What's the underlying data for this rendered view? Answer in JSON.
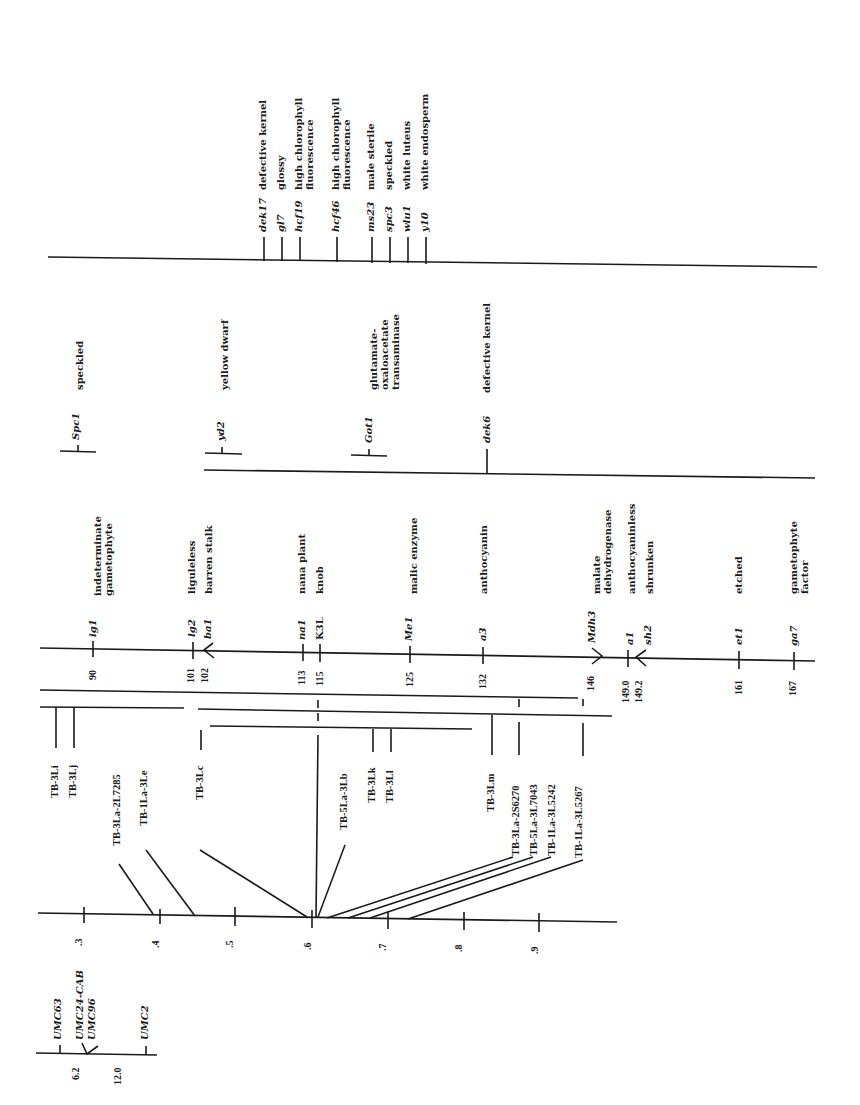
{
  "umc_map": {
    "markers": [
      {
        "name": "UMC63",
        "pos": null
      },
      {
        "name": "UMC24-CAB",
        "pos": null
      },
      {
        "name": "UMC96",
        "pos": null
      },
      {
        "name": "UMC2",
        "pos": null
      }
    ],
    "distances": [
      "6.2",
      "12.0"
    ]
  },
  "cytology_axis": {
    "ticks": [
      ".3",
      ".4",
      ".5",
      ".6",
      ".7",
      ".8",
      ".9"
    ]
  },
  "translocations": [
    "TB-3Li",
    "TB-3Lj",
    "TB-3La-2L7285",
    "TB-1La-3Le",
    "TB-3Lc",
    "TB-5La-3Lb",
    "TB-3Lk",
    "TB-3Ll",
    "TB-3Lm",
    "TB-3La-2S6270",
    "TB-5La-3L7043",
    "TB-1La-3L5242",
    "TB-1La-3L5267"
  ],
  "genetic_map": {
    "loci": [
      {
        "symbol": "ig1",
        "position": "90",
        "description": "indeterminate gametophyte"
      },
      {
        "symbol": "lg2",
        "position": "101",
        "description": "liguleless"
      },
      {
        "symbol": "ba1",
        "position": "102",
        "description": "barren stalk"
      },
      {
        "symbol": "na1",
        "position": "113",
        "description": "nana plant"
      },
      {
        "symbol": "K3L",
        "position": "115",
        "description": "knob"
      },
      {
        "symbol": "Me1",
        "position": "125",
        "description": "malic enzyme"
      },
      {
        "symbol": "a3",
        "position": "132",
        "description": "anthocyanin"
      },
      {
        "symbol": "Mdh3",
        "position": "146",
        "description": "malate dehydrogenase"
      },
      {
        "symbol": "a1",
        "position": "149.0",
        "description": "anthocyaninless"
      },
      {
        "symbol": "sh2",
        "position": "149.2",
        "description": "shrunken"
      },
      {
        "symbol": "et1",
        "position": "161",
        "description": "etched"
      },
      {
        "symbol": "ga7",
        "position": "167",
        "description": "gametophyte factor"
      }
    ]
  },
  "approx_loci": [
    {
      "symbol": "Spc1",
      "description": "speckled"
    },
    {
      "symbol": "yd2",
      "description": "yellow dwarf"
    },
    {
      "symbol": "Got1",
      "description": "glutamate-oxaloacetate transaminase"
    },
    {
      "symbol": "dek6",
      "description": "defective kernel"
    }
  ],
  "unplaced_loci": [
    {
      "symbol": "dek17",
      "description": "defective kernel"
    },
    {
      "symbol": "gl7",
      "description": "glossy"
    },
    {
      "symbol": "hcf19",
      "description": "high chlorophyll fluorescence"
    },
    {
      "symbol": "hcf46",
      "description": "high chlorophyll fluorescence"
    },
    {
      "symbol": "ms23",
      "description": "male sterile"
    },
    {
      "symbol": "spc3",
      "description": "speckled"
    },
    {
      "symbol": "wlu1",
      "description": "white luteus"
    },
    {
      "symbol": "y10",
      "description": "white endosperm"
    }
  ]
}
